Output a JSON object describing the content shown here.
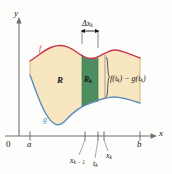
{
  "figure": {
    "kind": "area-between-curves-diagram",
    "axes": {
      "y_label": "y",
      "x_label": "x",
      "origin_label": "0"
    },
    "tick_labels": {
      "a": "a",
      "b": "b",
      "x_k_minus_1": "x",
      "x_k_minus_1_sub": "k − 1",
      "t_k": "t",
      "t_k_sub": "k",
      "x_k": "x",
      "x_k_sub": "k"
    },
    "curves": {
      "upper_label": "f",
      "lower_label": "g",
      "upper_color": "#c8374a",
      "lower_color": "#5a8fc0"
    },
    "regions": {
      "region_label": "R",
      "strip_label": "R",
      "strip_label_sub": "k",
      "region_fill": "#f7e6c0",
      "strip_fill": "#4e8d5f"
    },
    "annotations": {
      "width_label": "Δx",
      "width_label_sub": "k",
      "height_label_lead": "f(t",
      "height_label_sub1": "k",
      "height_label_mid": ") − g(t",
      "height_label_sub2": "k",
      "height_label_end": ")"
    },
    "colors": {
      "axis": "#6e6e6e",
      "text": "#151515"
    }
  }
}
